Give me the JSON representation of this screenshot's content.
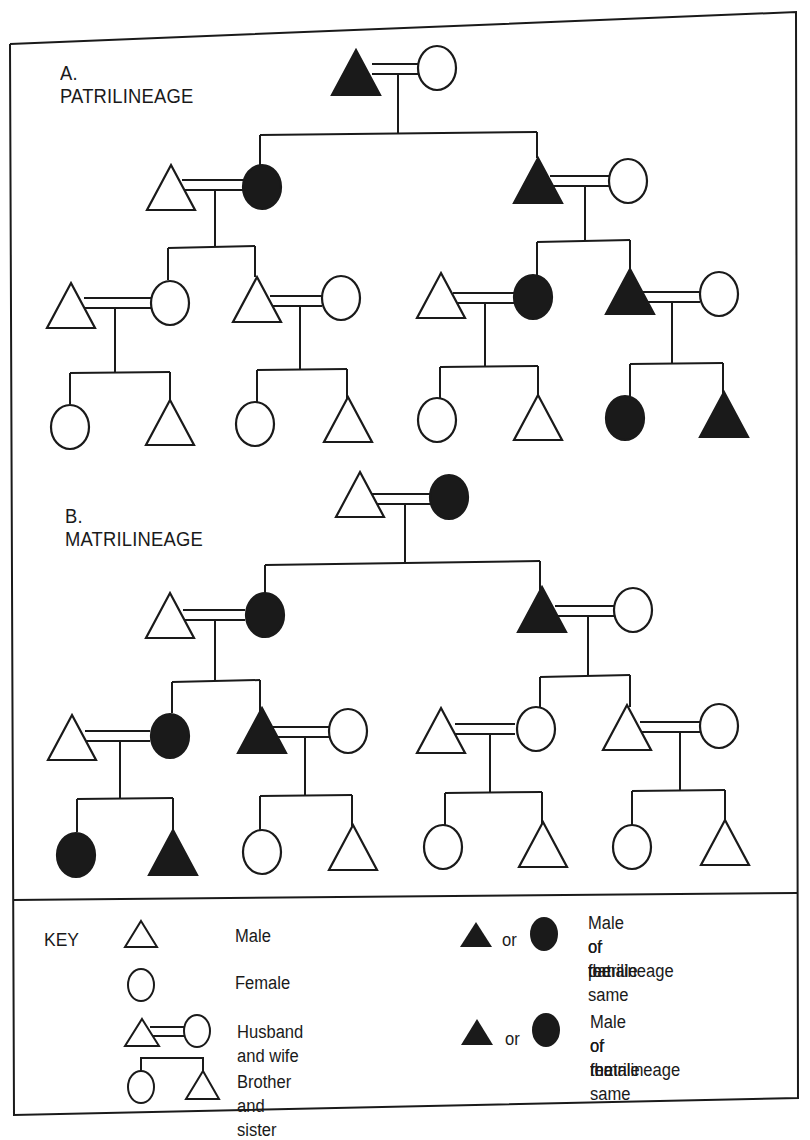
{
  "sections": {
    "a": {
      "title": "A. PATRILINEAGE",
      "highlighted_lineage": "patrilineage"
    },
    "b": {
      "title": "B. MATRILINEAGE",
      "highlighted_lineage": "matrilineage"
    }
  },
  "key": {
    "title": "KEY",
    "items": [
      {
        "symbol": "open-triangle",
        "label": "Male"
      },
      {
        "symbol": "open-circle",
        "label": "Female"
      },
      {
        "symbol": "triangle-double-line-circle",
        "label": "Husband and wife"
      },
      {
        "symbol": "circle-bracket-triangle",
        "label": "Brother and sister"
      }
    ],
    "lineage_items": [
      {
        "symbol": "filled-triangle-or-filled-circle",
        "or_text": "or",
        "label_lines": [
          "Male or female",
          "of the same",
          "patrilineage"
        ]
      },
      {
        "symbol": "filled-triangle-or-filled-circle",
        "or_text": "or",
        "label_lines": [
          "Male or female",
          "of the same",
          "matrilineage"
        ]
      }
    ]
  },
  "colors": {
    "ink": "#1a1a1a",
    "paper": "#ffffff"
  }
}
